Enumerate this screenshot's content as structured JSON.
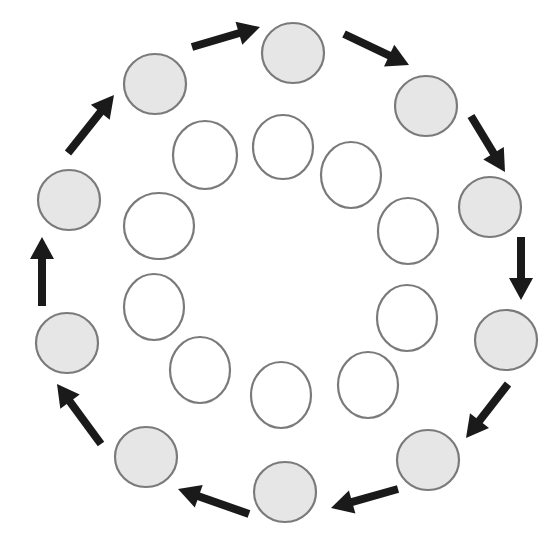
{
  "diagram": {
    "type": "cycle",
    "colors": {
      "outer_fill": "#e6e6e6",
      "outer_stroke": "#7a7a7a",
      "inner_fill": "#ffffff",
      "inner_stroke": "#7a7a7a",
      "arrow": "#1a1a1a",
      "background": "#ffffff"
    },
    "outer_nodes": [
      {
        "cx": 293,
        "cy": 53,
        "rx": 31,
        "ry": 30
      },
      {
        "cx": 426,
        "cy": 106,
        "rx": 31,
        "ry": 30
      },
      {
        "cx": 490,
        "cy": 207,
        "rx": 31,
        "ry": 30
      },
      {
        "cx": 506,
        "cy": 340,
        "rx": 31,
        "ry": 30
      },
      {
        "cx": 428,
        "cy": 460,
        "rx": 31,
        "ry": 30
      },
      {
        "cx": 285,
        "cy": 492,
        "rx": 31,
        "ry": 30
      },
      {
        "cx": 146,
        "cy": 457,
        "rx": 31,
        "ry": 30
      },
      {
        "cx": 67,
        "cy": 343,
        "rx": 31,
        "ry": 30
      },
      {
        "cx": 69,
        "cy": 200,
        "rx": 31,
        "ry": 30
      },
      {
        "cx": 155,
        "cy": 84,
        "rx": 31,
        "ry": 30
      }
    ],
    "inner_nodes": [
      {
        "cx": 205,
        "cy": 155,
        "rx": 32,
        "ry": 34
      },
      {
        "cx": 283,
        "cy": 147,
        "rx": 30,
        "ry": 32
      },
      {
        "cx": 351,
        "cy": 175,
        "rx": 30,
        "ry": 33
      },
      {
        "cx": 408,
        "cy": 231,
        "rx": 30,
        "ry": 33
      },
      {
        "cx": 407,
        "cy": 318,
        "rx": 30,
        "ry": 33
      },
      {
        "cx": 368,
        "cy": 385,
        "rx": 30,
        "ry": 33
      },
      {
        "cx": 281,
        "cy": 395,
        "rx": 30,
        "ry": 33
      },
      {
        "cx": 200,
        "cy": 370,
        "rx": 30,
        "ry": 33
      },
      {
        "cx": 154,
        "cy": 307,
        "rx": 30,
        "ry": 33
      },
      {
        "cx": 159,
        "cy": 226,
        "rx": 35,
        "ry": 33
      }
    ],
    "arrows": [
      {
        "from": 9,
        "to": 0,
        "x1": 192,
        "y1": 47,
        "x2": 260,
        "y2": 27
      },
      {
        "from": 0,
        "to": 1,
        "x1": 344,
        "y1": 34,
        "x2": 409,
        "y2": 65
      },
      {
        "from": 1,
        "to": 2,
        "x1": 471,
        "y1": 116,
        "x2": 505,
        "y2": 172
      },
      {
        "from": 2,
        "to": 3,
        "x1": 521,
        "y1": 237,
        "x2": 521,
        "y2": 300
      },
      {
        "from": 3,
        "to": 4,
        "x1": 508,
        "y1": 384,
        "x2": 466,
        "y2": 438
      },
      {
        "from": 4,
        "to": 5,
        "x1": 398,
        "y1": 489,
        "x2": 331,
        "y2": 508
      },
      {
        "from": 5,
        "to": 6,
        "x1": 249,
        "y1": 514,
        "x2": 178,
        "y2": 489
      },
      {
        "from": 6,
        "to": 7,
        "x1": 101,
        "y1": 444,
        "x2": 57,
        "y2": 384
      },
      {
        "from": 7,
        "to": 8,
        "x1": 42,
        "y1": 306,
        "x2": 42,
        "y2": 237
      },
      {
        "from": 8,
        "to": 9,
        "x1": 68,
        "y1": 153,
        "x2": 114,
        "y2": 95
      }
    ]
  }
}
